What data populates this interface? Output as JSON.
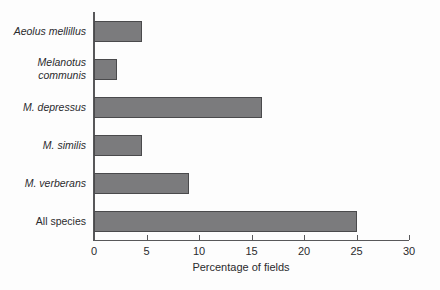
{
  "chart_data": {
    "type": "bar",
    "orientation": "horizontal",
    "title": "",
    "subtitle": "",
    "xlabel": "Percentage of fields",
    "ylabel": "",
    "categories": [
      "Aeolus mellillus",
      "Melanotus communis",
      "M. depressus",
      "M. similis",
      "M. verberans",
      "All species"
    ],
    "category_styles": [
      "italic",
      "italic",
      "italic",
      "italic",
      "italic",
      "normal"
    ],
    "values": [
      4.6,
      2.2,
      16.0,
      4.6,
      9.0,
      25.0
    ],
    "xlim": [
      0,
      30
    ],
    "xticks": [
      0,
      5,
      10,
      15,
      20,
      25,
      30
    ],
    "xtick_labels": [
      "0",
      "5",
      "10",
      "15",
      "20",
      "25",
      "30"
    ],
    "grid": false,
    "legend": false,
    "bar_color": "#7b7b7d",
    "bar_edge_color": "#4a4a4c",
    "axis_color": "#58585a",
    "background_color": "#fdfdfd"
  }
}
